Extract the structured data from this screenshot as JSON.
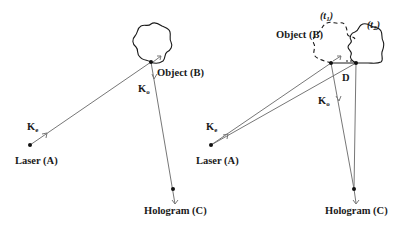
{
  "diagram": {
    "type": "holography-geometry",
    "panels": [
      {
        "id": "static",
        "labels": {
          "laser": "Laser (A)",
          "object": "Object (B)",
          "hologram": "Hologram (C)",
          "k_e": "K",
          "k_e_sub": "e",
          "k_o": "K",
          "k_o_sub": "o"
        }
      },
      {
        "id": "displaced",
        "labels": {
          "laser": "Laser (A)",
          "object": "Object (B)",
          "hologram": "Hologram (C)",
          "k_e": "K",
          "k_e_sub": "e",
          "k_o": "K",
          "k_o_sub": "o",
          "displacement": "D",
          "t1": "t",
          "t1_sub": "1",
          "t2": "t",
          "t2_sub": "2",
          "paren_open": "(",
          "paren_close": ")"
        }
      }
    ],
    "colors": {
      "ray": "#777777",
      "outline": "#1a1a1a",
      "point": "#111111",
      "background": "#ffffff"
    }
  }
}
